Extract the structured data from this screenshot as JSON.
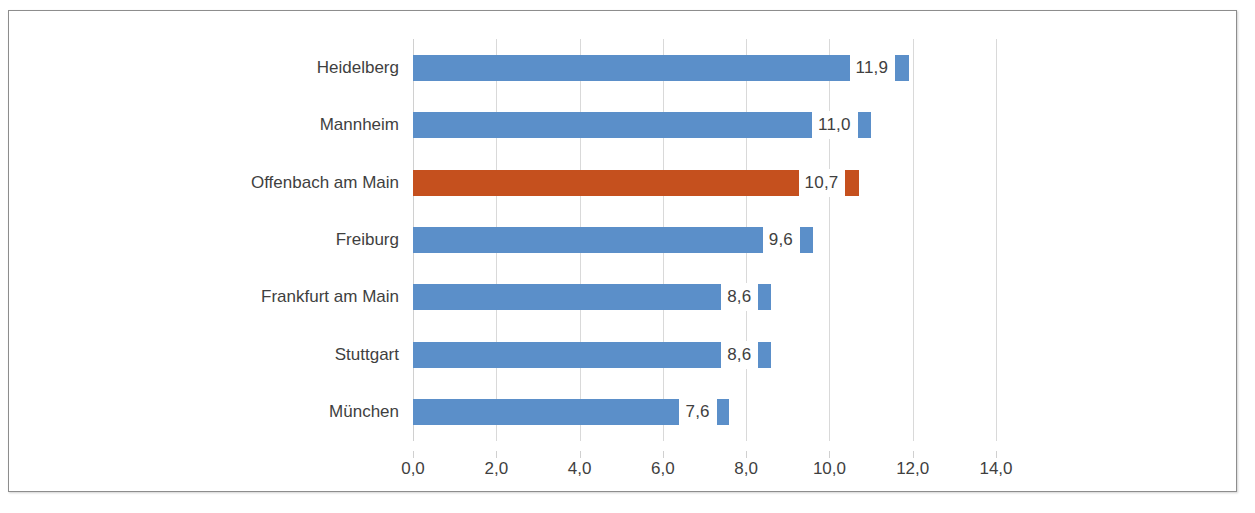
{
  "chart_data": {
    "type": "bar",
    "orientation": "horizontal",
    "title": "",
    "subtitle": "",
    "xlabel": "",
    "ylabel": "",
    "categories": [
      "Heidelberg",
      "Mannheim",
      "Offenbach am Main",
      "Freiburg",
      "Frankfurt am Main",
      "Stuttgart",
      "München"
    ],
    "values": [
      11.9,
      11.0,
      10.7,
      9.6,
      8.6,
      8.6,
      7.6
    ],
    "value_labels": [
      "11,9",
      "11,0",
      "10,7",
      "9,6",
      "8,6",
      "8,6",
      "7,6"
    ],
    "highlight_index": 2,
    "highlight_category": "Offenbach am Main",
    "xlim": [
      0.0,
      14.0
    ],
    "xtick_values": [
      0.0,
      2.0,
      4.0,
      6.0,
      8.0,
      10.0,
      12.0,
      14.0
    ],
    "xtick_labels": [
      "0,0",
      "2,0",
      "4,0",
      "6,0",
      "8,0",
      "10,0",
      "12,0",
      "14,0"
    ],
    "grid": "vertical",
    "legend": "none",
    "colors": {
      "bar": "#5b8fc9",
      "highlight_bar": "#c5501e",
      "gridline": "#d9d9d9",
      "text": "#3f3f3f",
      "frame_border": "#8d8d8d",
      "background": "#ffffff"
    }
  }
}
